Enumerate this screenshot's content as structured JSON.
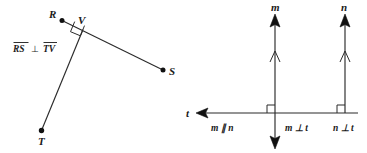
{
  "figure": {
    "background_color": "#ffffff",
    "ink_color": "#2b2b2b"
  },
  "left_diagram": {
    "name": "perpendicular-segments-diagram",
    "points": [
      {
        "id": "R",
        "label": "R",
        "x": 61,
        "y": 20
      },
      {
        "id": "V",
        "label": "V",
        "x": 83,
        "y": 29
      },
      {
        "id": "S",
        "label": "S",
        "x": 164,
        "y": 70
      },
      {
        "id": "T",
        "label": "T",
        "x": 41,
        "y": 131
      }
    ],
    "segments": [
      {
        "id": "RS",
        "from": "R",
        "to": "S"
      },
      {
        "id": "TV",
        "from": "T",
        "to": "V"
      }
    ],
    "right_angle_at": "V",
    "caption": {
      "first_segment": "RS",
      "relation": "⊥",
      "second_segment": "TV",
      "full_text": "RS ⊥ TV"
    }
  },
  "right_diagram": {
    "name": "parallel-perpendicular-lines-diagram",
    "lines": [
      {
        "id": "m",
        "label": "m",
        "orientation": "vertical",
        "x": 275,
        "arrows": [
          "up",
          "down"
        ],
        "parallel_tick": true
      },
      {
        "id": "n",
        "label": "n",
        "orientation": "vertical",
        "x": 345,
        "arrows": [
          "up"
        ],
        "parallel_tick": true
      },
      {
        "id": "t",
        "label": "t",
        "orientation": "horizontal",
        "y": 113,
        "arrows": [
          "left"
        ],
        "parallel_tick": false
      }
    ],
    "right_angles": [
      {
        "at": "m-t-intersection",
        "x": 275,
        "y": 113
      },
      {
        "at": "n-t-intersection",
        "x": 345,
        "y": 113
      }
    ],
    "relations": [
      {
        "id": "m-parallel-n",
        "text": "m ∥ n",
        "x": 223,
        "y": 130
      },
      {
        "id": "m-perp-t",
        "text": "m ⊥ t",
        "x": 288,
        "y": 130
      },
      {
        "id": "n-perp-t",
        "text": "n ⊥ t",
        "x": 337,
        "y": 130
      }
    ]
  }
}
